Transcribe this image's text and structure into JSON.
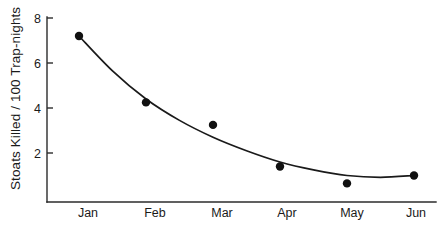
{
  "chart_data": {
    "type": "scatter",
    "title": "",
    "subtitle": "",
    "xlabel": "",
    "ylabel": "Stoats Killed / 100 Trap-nights",
    "categories": [
      "Jan",
      "Feb",
      "Mar",
      "Apr",
      "May",
      "Jun"
    ],
    "x": [
      1,
      2,
      3,
      4,
      5,
      6
    ],
    "values": [
      7.2,
      4.25,
      3.25,
      1.4,
      0.65,
      1.0
    ],
    "series": [
      {
        "name": "Stoats killed per 100 trap-nights",
        "values": [
          7.2,
          4.25,
          3.25,
          1.4,
          0.65,
          1.0
        ],
        "marker": "filled-circle",
        "color": "#111111"
      },
      {
        "name": "fitted curve",
        "type": "line",
        "color": "#1a1a1a",
        "points": [
          {
            "x": 1.0,
            "y": 7.2
          },
          {
            "x": 1.5,
            "y": 5.65
          },
          {
            "x": 2.0,
            "y": 4.4
          },
          {
            "x": 2.5,
            "y": 3.45
          },
          {
            "x": 3.0,
            "y": 2.7
          },
          {
            "x": 3.5,
            "y": 2.1
          },
          {
            "x": 4.0,
            "y": 1.6
          },
          {
            "x": 4.5,
            "y": 1.25
          },
          {
            "x": 5.0,
            "y": 1.0
          },
          {
            "x": 5.5,
            "y": 0.92
          },
          {
            "x": 6.0,
            "y": 1.0
          }
        ]
      }
    ],
    "ylim": [
      0,
      8
    ],
    "yticks": [
      2,
      4,
      6,
      8
    ],
    "ytick_labels": [
      "2",
      "4",
      "6",
      "8"
    ],
    "xtick_labels": [
      "Jan",
      "Feb",
      "Mar",
      "Apr",
      "May",
      "Jun"
    ],
    "grid": false,
    "legend": false,
    "legend_position": "none",
    "axis_color": "#2b2b2b",
    "background_color": "#ffffff"
  }
}
